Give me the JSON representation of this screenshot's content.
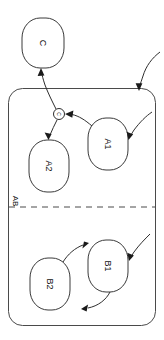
{
  "diagram": {
    "kind": "uml-statechart",
    "rotation_degrees": 90,
    "background_color": "#ffffff",
    "stroke_color": "#3a3a3a",
    "text_color": "#111111"
  },
  "states": {
    "c": {
      "label": "C",
      "kind": "simple-state"
    },
    "a1": {
      "label": "A1",
      "kind": "simple-state"
    },
    "a2": {
      "label": "A2",
      "kind": "simple-state"
    },
    "b1": {
      "label": "B1",
      "kind": "simple-state"
    },
    "b2": {
      "label": "B2",
      "kind": "simple-state"
    }
  },
  "composite": {
    "label": "AB",
    "kind": "composite-state",
    "regions": [
      {
        "id": "region-a",
        "members": [
          "A1",
          "A2"
        ]
      },
      {
        "id": "region-b",
        "members": [
          "B1",
          "B2"
        ]
      }
    ]
  },
  "pseudostates": {
    "junction": {
      "label": "C",
      "kind": "junction-pseudostate"
    }
  },
  "transitions": [
    {
      "id": "t-entry-ab",
      "from": "",
      "to": "AB",
      "kind": "entry-arrow"
    },
    {
      "id": "t-entry-a1",
      "from": "",
      "to": "A1",
      "kind": "entry-arrow"
    },
    {
      "id": "t-entry-b1",
      "from": "",
      "to": "B1",
      "kind": "entry-arrow"
    },
    {
      "id": "t-a1-junction",
      "from": "A1",
      "to": "junction",
      "kind": "curved"
    },
    {
      "id": "t-junction-a2",
      "from": "junction",
      "to": "A2",
      "kind": "straight"
    },
    {
      "id": "t-junction-c",
      "from": "junction",
      "to": "C",
      "kind": "curved-exit"
    },
    {
      "id": "t-b2-b1",
      "from": "B2",
      "to": "B1",
      "kind": "curved"
    },
    {
      "id": "t-b1-b2",
      "from": "B1",
      "to": "B2",
      "kind": "curved"
    }
  ]
}
